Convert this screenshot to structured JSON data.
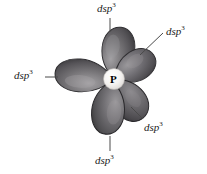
{
  "figure": {
    "type": "orbital-hybridization-diagram",
    "background_color": "#ffffff",
    "central_atom": {
      "symbol": "P",
      "name": "phosphorus",
      "color": "#000000",
      "core_color": "#f2f0ee",
      "x": 114,
      "y": 79
    },
    "orbital_color_dark": "#4b4a4c",
    "orbital_color_mid": "#6d6c6f",
    "orbital_color_light": "#9c9a9d",
    "orbital_outline": "#2c2b2d",
    "leader_line_color": "#4a4a4a",
    "geometry": "trigonal bipyramidal",
    "lobe_count": 5,
    "lobes": [
      {
        "id": "lobe-top",
        "direction": "up",
        "angle_deg": -84,
        "length": 52,
        "width": 34
      },
      {
        "id": "lobe-upper-right",
        "direction": "upper-right",
        "angle_deg": -33,
        "length": 44,
        "width": 30
      },
      {
        "id": "lobe-left",
        "direction": "left",
        "angle_deg": 184,
        "length": 62,
        "width": 34
      },
      {
        "id": "lobe-lower-right",
        "direction": "lower-right",
        "angle_deg": 52,
        "length": 46,
        "width": 32
      },
      {
        "id": "lobe-bottom",
        "direction": "down",
        "angle_deg": 95,
        "length": 54,
        "width": 34
      }
    ],
    "labels": [
      {
        "id": "label-top",
        "base": "dsp",
        "exponent": "3"
      },
      {
        "id": "label-upper-right",
        "base": "dsp",
        "exponent": "3"
      },
      {
        "id": "label-left",
        "base": "dsp",
        "exponent": "3"
      },
      {
        "id": "label-lower-right",
        "base": "dsp",
        "exponent": "3"
      },
      {
        "id": "label-bottom",
        "base": "dsp",
        "exponent": "3"
      }
    ],
    "leader_lines": [
      {
        "id": "leader-top",
        "x1": 110,
        "y1": 18,
        "x2": 110,
        "y2": 32
      },
      {
        "id": "leader-upper-right",
        "x1": 163,
        "y1": 33,
        "x2": 141,
        "y2": 54
      },
      {
        "id": "leader-left",
        "x1": 46,
        "y1": 77,
        "x2": 57,
        "y2": 77
      },
      {
        "id": "leader-lower-right",
        "x1": 142,
        "y1": 120,
        "x2": 131,
        "y2": 108
      },
      {
        "id": "leader-bottom",
        "x1": 110,
        "y1": 151,
        "x2": 110,
        "y2": 136
      }
    ]
  }
}
